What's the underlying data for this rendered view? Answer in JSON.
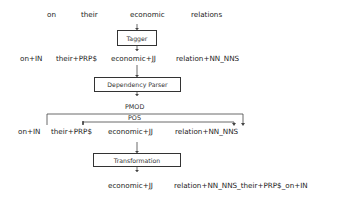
{
  "input_words": [
    "on",
    "their",
    "economic",
    "relations"
  ],
  "stages": {
    "tagger": "Tagger",
    "parser": "Dependency Parser",
    "transformation": "Transformation"
  },
  "tagged_tokens": [
    "on+IN",
    "their+PRP$",
    "economic+JJ",
    "relation+NN_NNS"
  ],
  "dependencies": [
    {
      "label": "PMOD",
      "from": "on+IN",
      "to": "relation+NN_NNS"
    },
    {
      "label": "POS",
      "from": "their+PRP$",
      "to": "relation+NN_NNS"
    }
  ],
  "parsed_tokens": [
    "on+IN",
    "their+PRP$",
    "economic+JJ",
    "relation+NN_NNS"
  ],
  "output_tokens": [
    "economic+JJ",
    "relation+NN_NNS_their+PRP$_on+IN"
  ]
}
